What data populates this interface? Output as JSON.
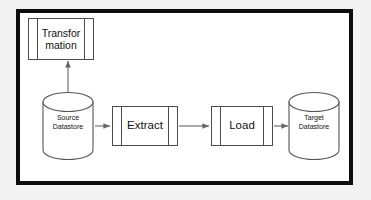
{
  "diagram": {
    "background_color": "#f2f2f2",
    "canvas_color": "#ffffff",
    "frame_color": "#0d0d0d",
    "stroke_color": "#4d4d4d",
    "text_color": "#111111"
  },
  "nodes": {
    "transformation": {
      "label": "Transfor\nmation",
      "type": "predefined-process",
      "x": 28,
      "y": 18,
      "width": 66,
      "height": 42
    },
    "source_datastore": {
      "label": "Source\nDatastore",
      "type": "cylinder",
      "x": 42,
      "y": 92,
      "width": 52,
      "height": 68
    },
    "extract": {
      "label": "Extract",
      "type": "predefined-process",
      "x": 112,
      "y": 106,
      "width": 66,
      "height": 40
    },
    "load": {
      "label": "Load",
      "type": "predefined-process",
      "x": 211,
      "y": 106,
      "width": 62,
      "height": 40
    },
    "target_datastore": {
      "label": "Target\nDatastore",
      "type": "cylinder",
      "x": 288,
      "y": 92,
      "width": 52,
      "height": 68
    }
  },
  "edges": [
    {
      "name": "source-to-transformation",
      "from": "source_datastore",
      "to": "transformation",
      "direction": "bidirectional",
      "label": ""
    },
    {
      "name": "source-to-extract",
      "from": "source_datastore",
      "to": "extract",
      "direction": "forward",
      "label": ""
    },
    {
      "name": "extract-to-load",
      "from": "extract",
      "to": "load",
      "direction": "forward",
      "label": ""
    },
    {
      "name": "load-to-target",
      "from": "load",
      "to": "target_datastore",
      "direction": "forward",
      "label": ""
    }
  ]
}
